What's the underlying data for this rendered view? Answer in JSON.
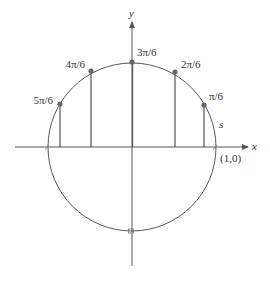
{
  "diagram": {
    "colors": {
      "stroke": "#555555",
      "point": "#666666",
      "text": "#333333",
      "background": "#ffffff"
    },
    "axes": {
      "x_label": "x",
      "y_label": "y"
    },
    "center": {
      "cx": 132,
      "cy": 147
    },
    "radius": 84,
    "points": [
      {
        "label": "π/6",
        "x": 204,
        "y": 105,
        "lx": 209,
        "ly": 100,
        "anchor": "start"
      },
      {
        "label": "2π/6",
        "x": 175,
        "y": 72,
        "lx": 182,
        "ly": 68,
        "anchor": "start"
      },
      {
        "label": "3π/6",
        "x": 132,
        "y": 63,
        "lx": 137,
        "ly": 57,
        "anchor": "start"
      },
      {
        "label": "4π/6",
        "x": 91,
        "y": 71,
        "lx": 86,
        "ly": 68,
        "anchor": "end"
      },
      {
        "label": "5π/6",
        "x": 60,
        "y": 104,
        "lx": 54,
        "ly": 104,
        "anchor": "end"
      }
    ],
    "annotations": {
      "arc_label": "s",
      "start_point_label": "(1,0)"
    }
  }
}
